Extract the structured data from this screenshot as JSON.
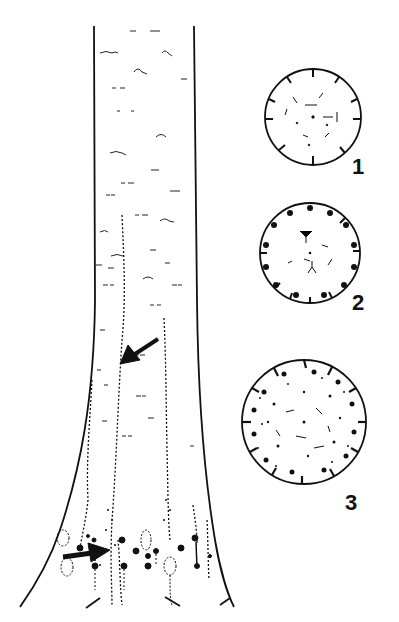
{
  "figure": {
    "colors": {
      "ink": "#111111",
      "background": "#ffffff"
    },
    "trunk": {
      "arrows": [
        {
          "name": "upper-arrow",
          "points_to": "vertical streak"
        },
        {
          "name": "lower-arrow",
          "points_to": "wound at trunk base"
        }
      ]
    },
    "cross_sections": [
      {
        "label": "1",
        "stage": "early"
      },
      {
        "label": "2",
        "stage": "intermediate"
      },
      {
        "label": "3",
        "stage": "advanced"
      }
    ]
  }
}
